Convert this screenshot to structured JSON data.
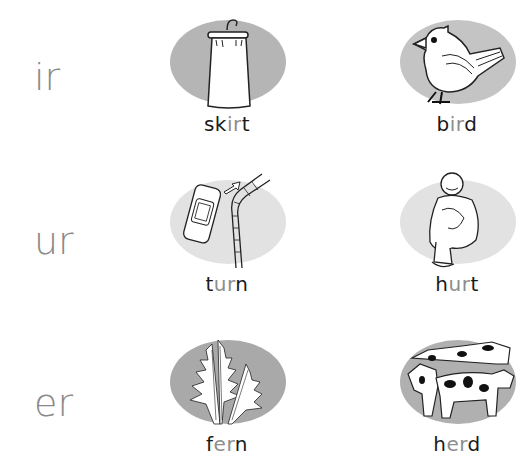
{
  "worksheet": {
    "rows": [
      {
        "phonics": "ir",
        "items": [
          {
            "word_pre": "sk",
            "word_hl": "ir",
            "word_post": "t",
            "picture": "skirt-on-hanger",
            "oval_color": "#b5b5b5"
          },
          {
            "word_pre": "b",
            "word_hl": "ir",
            "word_post": "d",
            "picture": "bird",
            "oval_color": "#c4c4c4"
          }
        ]
      },
      {
        "phonics": "ur",
        "items": [
          {
            "word_pre": "t",
            "word_hl": "ur",
            "word_post": "n",
            "picture": "car-turning-road",
            "oval_color": "#e2e2e2"
          },
          {
            "word_pre": "h",
            "word_hl": "ur",
            "word_post": "t",
            "picture": "hurt-child",
            "oval_color": "#e2e2e2"
          }
        ]
      },
      {
        "phonics": "er",
        "items": [
          {
            "word_pre": "f",
            "word_hl": "er",
            "word_post": "n",
            "picture": "fern",
            "oval_color": "#a9a9a9"
          },
          {
            "word_pre": "h",
            "word_hl": "er",
            "word_post": "d",
            "picture": "cow-herd",
            "oval_color": "#b0b0b0"
          }
        ]
      }
    ],
    "colors": {
      "phonics_text": "#8a8a8a",
      "word_text": "#1a1a1a",
      "highlight_text": "#8d8d8d"
    }
  }
}
